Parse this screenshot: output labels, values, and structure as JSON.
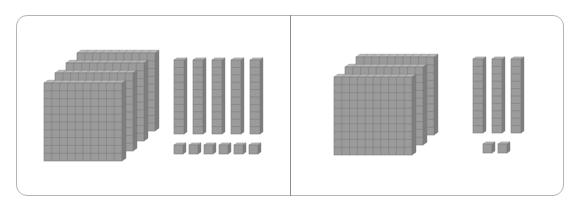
{
  "figure": {
    "colors": {
      "face": "#9b9b9b",
      "grid": "#7c7c7c",
      "side": "#7e7e7e",
      "top": "#b8b8b8",
      "frame": "#b4b4b4",
      "divider": "#8c8c8c"
    }
  },
  "panels": [
    {
      "name": "left",
      "hundreds": 4,
      "tens": 5,
      "ones": 6,
      "value": 456,
      "flat_front": {
        "x": 44,
        "y": 83,
        "size": 78
      },
      "flat_offset": {
        "dx": 11,
        "dy": -10
      },
      "rods": {
        "x0": 174,
        "pitch": 19,
        "y": 60,
        "w": 10,
        "h": 74
      },
      "units": {
        "x0": 174,
        "pitch": 15,
        "y": 145,
        "size": 9
      }
    },
    {
      "name": "right",
      "hundreds": 3,
      "tens": 3,
      "ones": 2,
      "value": 332,
      "flat_front": {
        "x": 334,
        "y": 77,
        "size": 78
      },
      "flat_offset": {
        "dx": 11,
        "dy": -10
      },
      "rods": {
        "x0": 473,
        "pitch": 19,
        "y": 59,
        "w": 10,
        "h": 74
      },
      "units": {
        "x0": 483,
        "pitch": 15,
        "y": 144,
        "size": 9
      }
    }
  ]
}
